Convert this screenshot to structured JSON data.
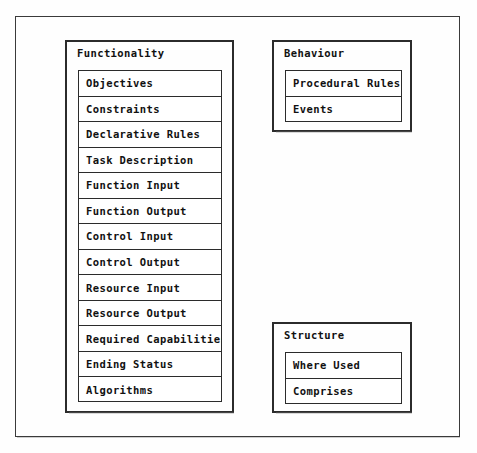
{
  "diagram": {
    "type": "nested-box-list-diagram",
    "background_color": "#fefefe",
    "line_color": "#2b2b2b",
    "text_color": "#111111",
    "groups": [
      {
        "id": "functionality",
        "title": "Functionality",
        "rows": [
          "Objectives",
          "Constraints",
          "Declarative Rules",
          "Task Description",
          "Function Input",
          "Function Output",
          "Control Input",
          "Control Output",
          "Resource Input",
          "Resource Output",
          "Required Capabilities",
          "Ending Status",
          "Algorithms"
        ]
      },
      {
        "id": "behaviour",
        "title": "Behaviour",
        "rows": [
          "Procedural Rules",
          "Events"
        ]
      },
      {
        "id": "structure",
        "title": "Structure",
        "rows": [
          "Where Used",
          "Comprises"
        ]
      }
    ]
  }
}
